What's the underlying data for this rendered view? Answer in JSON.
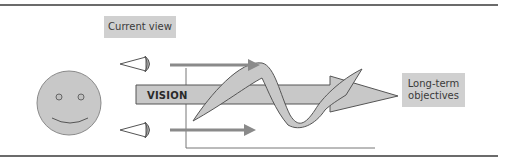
{
  "diagram": {
    "labels": {
      "current_view": "Current view",
      "vision": "VISION",
      "long_term_line1": "Long-term",
      "long_term_line2": "objectives"
    },
    "elements": {
      "person": "smiley-face",
      "eye_top": "eye-icon",
      "eye_bottom": "eye-icon",
      "vision_arrow": "wide arrow pointing right toward long-term objectives",
      "wave": "wavy path crossing the vision arrow"
    },
    "colors": {
      "fill_gray": "#c8c8c8",
      "box_gray": "#d0d0d0",
      "arrow_gray": "#8a8a8a",
      "outline": "#555555",
      "rule": "#6b6b6b"
    }
  }
}
